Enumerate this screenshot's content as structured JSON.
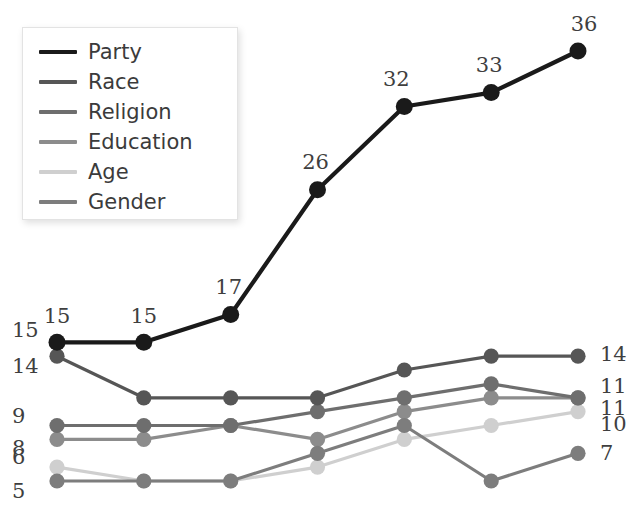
{
  "figure": {
    "clipped_title": "",
    "background": "#ffffff"
  },
  "legend": {
    "position": "top-left",
    "items": [
      {
        "label": "Party",
        "color": "#1a1a1a"
      },
      {
        "label": "Race",
        "color": "#565656"
      },
      {
        "label": "Religion",
        "color": "#6e6e6e"
      },
      {
        "label": "Education",
        "color": "#8c8c8c"
      },
      {
        "label": "Age",
        "color": "#cfcfcf"
      },
      {
        "label": "Gender",
        "color": "#7d7d7d"
      }
    ]
  },
  "chart_data": {
    "type": "line",
    "title": "",
    "xlabel": "",
    "ylabel": "",
    "x": [
      1,
      2,
      3,
      4,
      5,
      6,
      7
    ],
    "categories": [
      "1",
      "2",
      "3",
      "4",
      "5",
      "6",
      "7"
    ],
    "ylim": [
      0,
      40
    ],
    "grid": false,
    "axes_visible": false,
    "legend_position": "top-left",
    "series": [
      {
        "name": "Party",
        "color": "#1a1a1a",
        "values": [
          15,
          15,
          17,
          26,
          32,
          33,
          36
        ],
        "start_label": "15",
        "end_label": "36"
      },
      {
        "name": "Race",
        "color": "#565656",
        "values": [
          14,
          11,
          11,
          11,
          13,
          14,
          14
        ],
        "start_label": "14",
        "end_label": "14"
      },
      {
        "name": "Religion",
        "color": "#6e6e6e",
        "values": [
          9,
          9,
          9,
          10,
          11,
          12,
          11
        ],
        "start_label": "9",
        "end_label": "11"
      },
      {
        "name": "Education",
        "color": "#8c8c8c",
        "values": [
          8,
          8,
          9,
          8,
          10,
          11,
          11
        ],
        "start_label": "8",
        "end_label": "11"
      },
      {
        "name": "Age",
        "color": "#cfcfcf",
        "values": [
          6,
          5,
          5,
          6,
          8,
          9,
          10
        ],
        "start_label": "6",
        "end_label": "10"
      },
      {
        "name": "Gender",
        "color": "#7d7d7d",
        "values": [
          5,
          5,
          5,
          7,
          9,
          5,
          7
        ],
        "start_label": "5",
        "end_label": "7"
      }
    ],
    "point_labels": {
      "series": "Party",
      "values": [
        "15",
        "15",
        "17",
        "26",
        "32",
        "33",
        "36"
      ]
    },
    "left_axis_labels": [
      "15",
      "14",
      "9",
      "8",
      "6",
      "5"
    ],
    "right_axis_labels": [
      "14",
      "11",
      "11",
      "10",
      "7"
    ]
  }
}
